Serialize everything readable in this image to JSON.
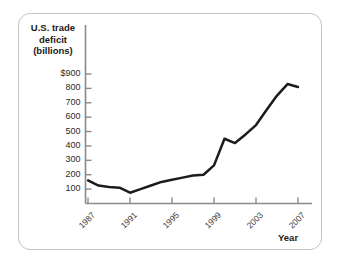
{
  "figure": {
    "border_color": "#c3c3c3",
    "background": "#ffffff"
  },
  "chart_data": {
    "type": "line",
    "title": "",
    "subtitle": "",
    "ylabel": "U.S. trade deficit (billions)",
    "ylabel_lines": [
      "U.S. trade",
      "deficit",
      "(billions)"
    ],
    "xlabel": "Year",
    "xlim": [
      1987,
      2007
    ],
    "ylim": [
      0,
      900
    ],
    "grid": false,
    "legend": "none",
    "line_color": "#1c1c1c",
    "line_width": 2.5,
    "ytick_labels": [
      "$900",
      "800",
      "700",
      "600",
      "500",
      "400",
      "300",
      "200",
      "100"
    ],
    "ytick_values": [
      900,
      800,
      700,
      600,
      500,
      400,
      300,
      200,
      100
    ],
    "xtick_labels": [
      "1987",
      "1991",
      "1995",
      "1999",
      "2003",
      "2007"
    ],
    "xtick_values": [
      1987,
      1991,
      1995,
      1999,
      2003,
      2007
    ],
    "x": [
      1987,
      1988,
      1989,
      1990,
      1991,
      1992,
      1993,
      1994,
      1995,
      1996,
      1997,
      1998,
      1999,
      2000,
      2001,
      2002,
      2003,
      2004,
      2005,
      2006,
      2007
    ],
    "values": [
      160,
      125,
      115,
      110,
      75,
      100,
      125,
      150,
      165,
      180,
      195,
      200,
      265,
      450,
      420,
      480,
      545,
      650,
      750,
      830,
      810
    ],
    "series": [
      {
        "name": "U.S. trade deficit",
        "values": [
          160,
          125,
          115,
          110,
          75,
          100,
          125,
          150,
          165,
          180,
          195,
          200,
          265,
          450,
          420,
          480,
          545,
          650,
          750,
          830,
          810
        ]
      }
    ],
    "annotations": []
  }
}
